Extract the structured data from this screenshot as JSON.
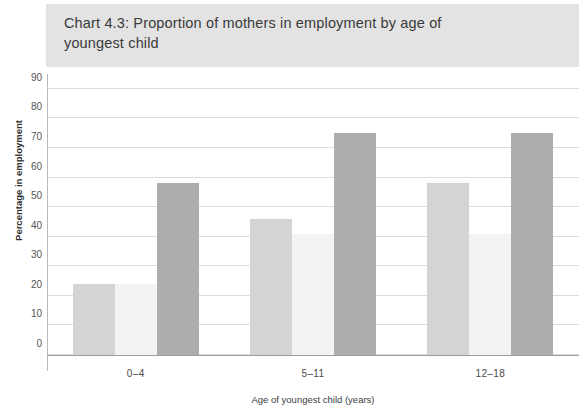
{
  "chart_data": {
    "type": "bar",
    "title": "Chart 4.3: Proportion of mothers in employment by age of\n        youngest child",
    "xlabel": "Age of youngest child (years)",
    "ylabel": "Percentage in employment",
    "categories": [
      "0–4",
      "5–11",
      "12–18"
    ],
    "series": [
      {
        "name": "series-1",
        "values": [
          24,
          46,
          58
        ],
        "color": "#d4d4d4"
      },
      {
        "name": "series-2",
        "values": [
          24,
          41,
          41
        ],
        "color": "#f3f3f3"
      },
      {
        "name": "series-3",
        "values": [
          58,
          75,
          75
        ],
        "color": "#adadad"
      }
    ],
    "ylim": [
      0,
      95
    ],
    "yticks": [
      0,
      10,
      20,
      30,
      40,
      50,
      60,
      70,
      80,
      90
    ],
    "ytick_labels": [
      "0",
      "10",
      "20",
      "30",
      "40",
      "50",
      "60",
      "70",
      "80",
      "90"
    ],
    "grid": true,
    "legend": "none",
    "banner_color": "#e3e3e3",
    "gridline_color": "#dcdcdc",
    "axis_color": "#9d9d9d"
  }
}
